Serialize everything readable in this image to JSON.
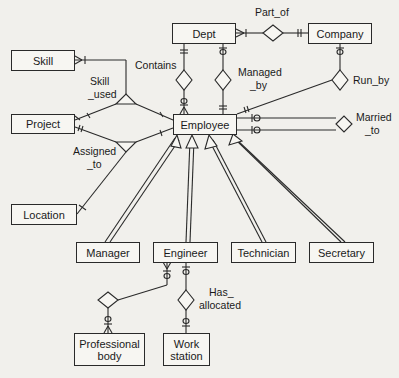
{
  "diagram": {
    "type": "entity-relationship",
    "colors": {
      "background": "#f1f0ec",
      "line": "#2a2a2a",
      "entity_fill": "#f7f6f2"
    },
    "entities": {
      "dept": "Dept",
      "company": "Company",
      "skill": "Skill",
      "project": "Project",
      "employee": "Employee",
      "location": "Location",
      "manager": "Manager",
      "engineer": "Engineer",
      "technician": "Technician",
      "secretary": "Secretary",
      "professional_body": "Professional body",
      "work_station": "Work station"
    },
    "relationships": {
      "part_of": "Part_of",
      "contains": "Contains",
      "managed_by_1": "Managed",
      "managed_by_2": "_by",
      "run_by": "Run_by",
      "married_to_1": "Married",
      "married_to_2": "_to",
      "skill_used_1": "Skill",
      "skill_used_2": "_used",
      "assigned_to_1": "Assigned",
      "assigned_to_2": "_to",
      "has_allocated_1": "Has_",
      "has_allocated_2": "allocated"
    }
  }
}
